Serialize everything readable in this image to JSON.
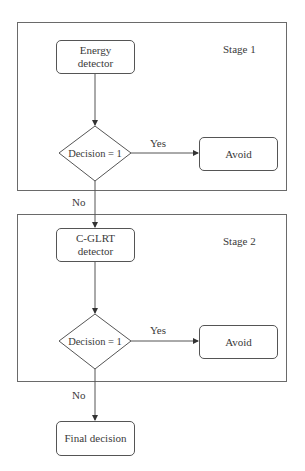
{
  "diagram": {
    "type": "flowchart",
    "stages": [
      {
        "label": "Stage 1",
        "detector": "Energy\ndetector",
        "detector_lines": [
          "Energy",
          "detector"
        ],
        "decision": "Decision = 1",
        "yes_label": "Yes",
        "yes_target": "Avoid",
        "no_label": "No"
      },
      {
        "label": "Stage 2",
        "detector": "C-GLRT\ndetector",
        "detector_lines": [
          "C-GLRT",
          "detector"
        ],
        "decision": "Decision = 1",
        "yes_label": "Yes",
        "yes_target": "Avoid",
        "no_label": "No"
      }
    ],
    "final_node": "Final decision",
    "edges": [
      {
        "from": "Energy detector",
        "to": "Decision = 1 (Stage 1)"
      },
      {
        "from": "Decision = 1 (Stage 1)",
        "to": "Avoid (Stage 1)",
        "label": "Yes"
      },
      {
        "from": "Decision = 1 (Stage 1)",
        "to": "C-GLRT detector",
        "label": "No"
      },
      {
        "from": "C-GLRT detector",
        "to": "Decision = 1 (Stage 2)"
      },
      {
        "from": "Decision = 1 (Stage 2)",
        "to": "Avoid (Stage 2)",
        "label": "Yes"
      },
      {
        "from": "Decision = 1 (Stage 2)",
        "to": "Final decision",
        "label": "No"
      }
    ],
    "colors": {
      "line": "#555555",
      "text": "#3a3a3a",
      "background": "#ffffff"
    }
  }
}
